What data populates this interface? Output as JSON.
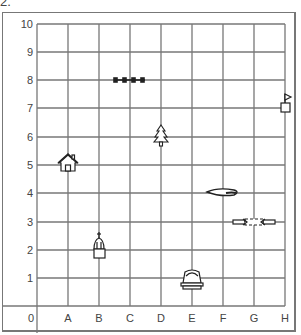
{
  "problem_label": "2.",
  "grid": {
    "x_labels": [
      "0",
      "A",
      "B",
      "C",
      "D",
      "E",
      "F",
      "G",
      "H"
    ],
    "y_labels": [
      "1",
      "2",
      "3",
      "4",
      "5",
      "6",
      "7",
      "8",
      "9",
      "10"
    ],
    "line_color": "#777777"
  },
  "objects": [
    {
      "name": "house",
      "col": "A",
      "row": 5
    },
    {
      "name": "church",
      "col": "B",
      "row": 2
    },
    {
      "name": "fence",
      "col": "C",
      "row": 8
    },
    {
      "name": "pine-tree",
      "col": "D",
      "row": 6
    },
    {
      "name": "building",
      "col": "E",
      "row": 1
    },
    {
      "name": "blimp",
      "col": "F",
      "row": 4
    },
    {
      "name": "bridge",
      "col": "G",
      "row": 3
    },
    {
      "name": "flag-box",
      "col": "H",
      "row": 7
    }
  ]
}
